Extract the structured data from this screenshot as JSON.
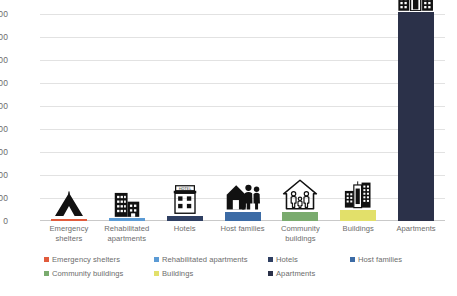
{
  "chart_data": {
    "type": "bar",
    "title": "",
    "xlabel": "",
    "ylabel": "",
    "ylim": [
      0,
      1800
    ],
    "ytick_step": 200,
    "grid": true,
    "legend_position": "bottom",
    "categories": [
      "Emergency shelters",
      "Rehabilitated apartments",
      "Hotels",
      "Host families",
      "Community buildings",
      "Buildings",
      "Apartments"
    ],
    "values": [
      18,
      25,
      40,
      75,
      80,
      100,
      1820
    ],
    "colors": [
      "#e15b3c",
      "#5b9bd5",
      "#2f3f62",
      "#3c6ba5",
      "#7aab6e",
      "#e2e06a",
      "#2b3149"
    ],
    "ytick_labels": [
      "0",
      "200",
      "400",
      "600",
      "800",
      "1000",
      "1200",
      "1400",
      "1600",
      "1800"
    ],
    "icons": [
      "tent-icon",
      "two-buildings-icon",
      "hotel-icon",
      "house-with-family-icon",
      "house-outline-with-people-icon",
      "city-buildings-icon",
      "apartment-towers-icon"
    ]
  },
  "legend": {
    "rows": [
      [
        {
          "label": "Emergency shelters",
          "color": "#e15b3c",
          "left": 0
        },
        {
          "label": "Rehabilitated apartments",
          "color": "#5b9bd5",
          "left": 110
        },
        {
          "label": "Hotels",
          "color": "#2f3f62",
          "left": 224
        },
        {
          "label": "Host families",
          "color": "#3c6ba5",
          "left": 306
        }
      ],
      [
        {
          "label": "Community buildings",
          "color": "#7aab6e",
          "left": 0
        },
        {
          "label": "Buildings",
          "color": "#e2e06a",
          "left": 110
        },
        {
          "label": "Apartments",
          "color": "#2b3149",
          "left": 224
        }
      ]
    ]
  }
}
